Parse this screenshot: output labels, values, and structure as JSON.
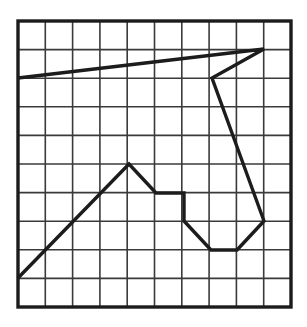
{
  "figure": {
    "background_color": "#ffffff",
    "canvas": {
      "width": 307,
      "height": 327
    }
  },
  "grid": {
    "name": "square-grid",
    "columns": 10,
    "rows": 10,
    "x0": 18,
    "y0": 21,
    "x1": 291,
    "y1": 307,
    "cell_width": 27.3,
    "cell_height": 28.6,
    "line_color": "#3a3a3a",
    "inner_line_width": 1.6,
    "border_color": "#1c1c1c",
    "border_line_width": 3.4
  },
  "chart_data": {
    "type": "line",
    "xlabel": "",
    "ylabel": "",
    "grid": true,
    "legend": "none",
    "xlim": [
      0,
      10
    ],
    "ylim": [
      0,
      10
    ],
    "axis_note": "Coordinates given in grid-cell units; origin at bottom-left of the 10x10 grid, y increasing upward.",
    "series": [
      {
        "name": "polyline",
        "stroke_color": "#1c1c1c",
        "stroke_width": 3.4,
        "closed": false,
        "points_grid": [
          [
            0.0,
            8.0
          ],
          [
            9.0,
            9.0
          ],
          [
            7.1,
            8.0
          ],
          [
            9.0,
            3.0
          ],
          [
            8.0,
            2.0
          ],
          [
            7.1,
            2.0
          ],
          [
            6.1,
            3.0
          ],
          [
            6.1,
            4.0
          ],
          [
            5.1,
            4.0
          ],
          [
            4.1,
            5.0
          ],
          [
            0.0,
            1.0
          ]
        ],
        "points_px": [
          [
            18,
            78
          ],
          [
            264,
            49
          ],
          [
            212,
            78
          ],
          [
            264,
            221
          ],
          [
            237,
            250
          ],
          [
            211,
            250
          ],
          [
            184,
            221
          ],
          [
            184,
            193
          ],
          [
            156,
            193
          ],
          [
            129,
            164
          ],
          [
            18,
            278
          ]
        ]
      }
    ]
  }
}
